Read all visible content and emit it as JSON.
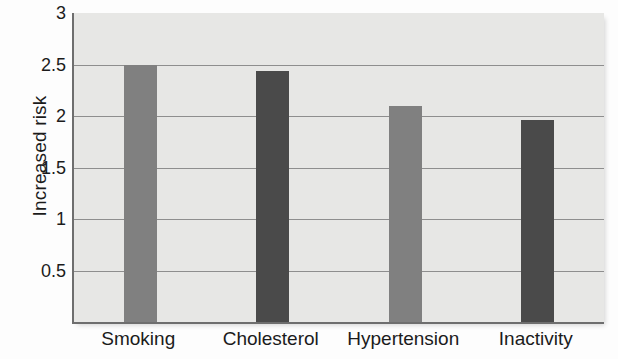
{
  "chart_data": {
    "type": "bar",
    "title": "",
    "subtitle": "",
    "xlabel": "",
    "ylabel": "Increased risk",
    "categories": [
      "Smoking",
      "Cholesterol",
      "Hypertension",
      "Inactivity"
    ],
    "values": [
      2.5,
      2.44,
      2.1,
      1.96
    ],
    "series": [
      {
        "name": "Increased risk",
        "values": [
          2.5,
          2.44,
          2.1,
          1.96
        ]
      }
    ],
    "bar_colors": [
      "#808080",
      "#4a4a4a",
      "#808080",
      "#4a4a4a"
    ],
    "ylim": [
      0,
      3
    ],
    "xlim": [
      0,
      4
    ],
    "y_ticks": [
      0.5,
      1,
      1.5,
      2,
      2.5,
      3
    ],
    "y_tick_labels": [
      "0.5",
      "1",
      "1.5",
      "2",
      "2.5",
      "3"
    ],
    "grid": true,
    "grid_axis": "y",
    "legend": false,
    "legend_position": "none",
    "plot_background": "#e7e7e5",
    "axis_color": "#6e6e6e",
    "gridline_color": "#8e8e8e",
    "text_color": "#1b1b1b"
  }
}
